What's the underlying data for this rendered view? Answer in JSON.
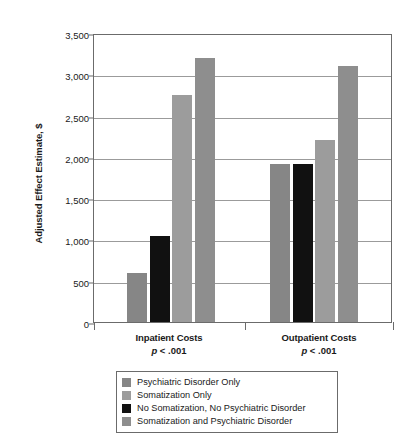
{
  "chart_data": {
    "type": "bar",
    "title": "",
    "xlabel": "",
    "ylabel": "Adjusted Effect Estimate, $",
    "ylim": [
      0,
      3500
    ],
    "ytick_values": [
      0,
      500,
      1000,
      1500,
      2000,
      2500,
      3000,
      3500
    ],
    "ytick_labels": [
      "0",
      "500",
      "1,000",
      "1,500",
      "2,000",
      "2,500",
      "3,000",
      "3,500"
    ],
    "grid": "horizontal",
    "legend_position": "below",
    "categories": [
      "Inpatient Costs",
      "Outpatient Costs"
    ],
    "category_annotations": [
      "p < .001",
      "p < .001"
    ],
    "series": [
      {
        "name": "Psychiatric Disorder Only",
        "color": "#868686",
        "values": [
          590,
          1910
        ]
      },
      {
        "name": "Somatization Only",
        "color": "#9c9c9c",
        "values": [
          2750,
          2200
        ]
      },
      {
        "name": "No Somatization, No Psychiatric Disorder",
        "color": "#111111",
        "values": [
          1040,
          1910
        ]
      },
      {
        "name": "Somatization and Psychiatric Disorder",
        "color": "#8e8e8e",
        "values": [
          3200,
          3100
        ]
      }
    ],
    "bar_draw_order": [
      "Psychiatric Disorder Only",
      "No Somatization, No Psychiatric Disorder",
      "Somatization Only",
      "Somatization and Psychiatric Disorder"
    ]
  },
  "axis": {
    "y_title": "Adjusted Effect Estimate, $",
    "ticks": [
      {
        "label": "3,500",
        "value": 3500
      },
      {
        "label": "3,000",
        "value": 3000
      },
      {
        "label": "2,500",
        "value": 2500
      },
      {
        "label": "2,000",
        "value": 2000
      },
      {
        "label": "1,500",
        "value": 1500
      },
      {
        "label": "1,000",
        "value": 1000
      },
      {
        "label": "500",
        "value": 500
      },
      {
        "label": "0",
        "value": 0
      }
    ]
  },
  "categories": [
    {
      "name": "Inpatient Costs",
      "pvalue": "p < .001",
      "p_italic": "p",
      "p_rest": " < .001"
    },
    {
      "name": "Outpatient Costs",
      "pvalue": "p < .001",
      "p_italic": "p",
      "p_rest": " < .001"
    }
  ],
  "legend": {
    "items": [
      {
        "label": "Psychiatric Disorder Only",
        "color": "#868686"
      },
      {
        "label": "Somatization Only",
        "color": "#9c9c9c"
      },
      {
        "label": "No Somatization, No Psychiatric Disorder",
        "color": "#111111"
      },
      {
        "label": "Somatization and Psychiatric Disorder",
        "color": "#8e8e8e"
      }
    ]
  }
}
